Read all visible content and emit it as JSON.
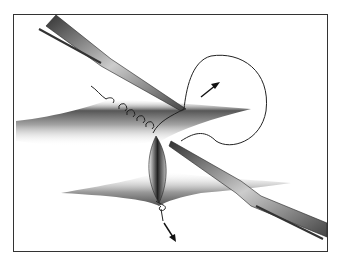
{
  "figure": {
    "elements": [
      "tissue-upper",
      "tissue-lower",
      "wound-gap",
      "forceps-upper",
      "forceps-lower",
      "suture-loop",
      "arrow-up-right",
      "arrow-down"
    ],
    "colors": {
      "frame": "#333333",
      "tissue_dark": "#2a2a2a",
      "tissue_light": "#ffffff",
      "instrument": "#555555",
      "thread": "#222222"
    }
  }
}
